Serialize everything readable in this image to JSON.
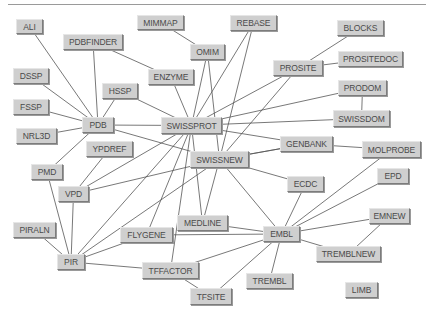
{
  "diagram": {
    "type": "database-link-graph",
    "colors": {
      "node_fill": "#cfcfcf",
      "node_text": "#4a4a4a",
      "edge": "#555555",
      "background": "#ffffff"
    },
    "nodes": [
      {
        "id": "ALI",
        "label": "ALI",
        "x": 16,
        "y": 19,
        "w": 27,
        "h": 15
      },
      {
        "id": "MIMMAP",
        "label": "MIMMAP",
        "x": 137,
        "y": 15,
        "w": 47,
        "h": 15
      },
      {
        "id": "REBASE",
        "label": "REBASE",
        "x": 230,
        "y": 15,
        "w": 47,
        "h": 16
      },
      {
        "id": "BLOCKS",
        "label": "BLOCKS",
        "x": 337,
        "y": 20,
        "w": 47,
        "h": 16
      },
      {
        "id": "PDBFINDER",
        "label": "PDBFINDER",
        "x": 63,
        "y": 34,
        "w": 60,
        "h": 16
      },
      {
        "id": "OMIM",
        "label": "OMIM",
        "x": 190,
        "y": 44,
        "w": 35,
        "h": 16
      },
      {
        "id": "PROSITEDOC",
        "label": "PROSITEDOC",
        "x": 338,
        "y": 51,
        "w": 65,
        "h": 16
      },
      {
        "id": "ENZYME",
        "label": "ENZYME",
        "x": 148,
        "y": 69,
        "w": 46,
        "h": 16
      },
      {
        "id": "PROSITE",
        "label": "PROSITE",
        "x": 273,
        "y": 60,
        "w": 50,
        "h": 16
      },
      {
        "id": "DSSP",
        "label": "DSSP",
        "x": 13,
        "y": 68,
        "w": 36,
        "h": 16
      },
      {
        "id": "PRODOM",
        "label": "PRODOM",
        "x": 338,
        "y": 80,
        "w": 49,
        "h": 16
      },
      {
        "id": "HSSP",
        "label": "HSSP",
        "x": 102,
        "y": 83,
        "w": 36,
        "h": 16
      },
      {
        "id": "FSSP",
        "label": "FSSP",
        "x": 13,
        "y": 99,
        "w": 36,
        "h": 16
      },
      {
        "id": "PDB",
        "label": "PDB",
        "x": 82,
        "y": 117,
        "w": 32,
        "h": 16
      },
      {
        "id": "SWISSPROT",
        "label": "SWISSPROT",
        "x": 161,
        "y": 117,
        "w": 61,
        "h": 17
      },
      {
        "id": "SWISSDOM",
        "label": "SWISSDOM",
        "x": 333,
        "y": 110,
        "w": 57,
        "h": 17
      },
      {
        "id": "NRL3D",
        "label": "NRL3D",
        "x": 16,
        "y": 128,
        "w": 41,
        "h": 16
      },
      {
        "id": "GENBANK",
        "label": "GENBANK",
        "x": 280,
        "y": 136,
        "w": 53,
        "h": 16
      },
      {
        "id": "YPDREF",
        "label": "YPDREF",
        "x": 86,
        "y": 141,
        "w": 47,
        "h": 16
      },
      {
        "id": "SWISSNEW",
        "label": "SWISSNEW",
        "x": 190,
        "y": 151,
        "w": 59,
        "h": 17
      },
      {
        "id": "MOLPROBE",
        "label": "MOLPROBE",
        "x": 362,
        "y": 141,
        "w": 59,
        "h": 17
      },
      {
        "id": "PMD",
        "label": "PMD",
        "x": 31,
        "y": 164,
        "w": 32,
        "h": 16
      },
      {
        "id": "ECDC",
        "label": "ECDC",
        "x": 287,
        "y": 176,
        "w": 37,
        "h": 16
      },
      {
        "id": "EPD",
        "label": "EPD",
        "x": 377,
        "y": 168,
        "w": 32,
        "h": 16
      },
      {
        "id": "VPD",
        "label": "VPD",
        "x": 58,
        "y": 186,
        "w": 31,
        "h": 16
      },
      {
        "id": "MEDLINE",
        "label": "MEDLINE",
        "x": 177,
        "y": 215,
        "w": 51,
        "h": 16
      },
      {
        "id": "EMNEW",
        "label": "EMNEW",
        "x": 369,
        "y": 208,
        "w": 41,
        "h": 16
      },
      {
        "id": "FLYGENE",
        "label": "FLYGENE",
        "x": 120,
        "y": 227,
        "w": 53,
        "h": 16
      },
      {
        "id": "EMBL",
        "label": "EMBL",
        "x": 263,
        "y": 226,
        "w": 37,
        "h": 16
      },
      {
        "id": "PIRALN",
        "label": "PIRALN",
        "x": 13,
        "y": 222,
        "w": 43,
        "h": 16
      },
      {
        "id": "TREMBLNEW",
        "label": "TREMBLNEW",
        "x": 316,
        "y": 246,
        "w": 65,
        "h": 16
      },
      {
        "id": "PIR",
        "label": "PIR",
        "x": 57,
        "y": 254,
        "w": 28,
        "h": 16
      },
      {
        "id": "TFFACTOR",
        "label": "TFFACTOR",
        "x": 142,
        "y": 262,
        "w": 57,
        "h": 17
      },
      {
        "id": "TREMBL",
        "label": "TREMBL",
        "x": 246,
        "y": 273,
        "w": 47,
        "h": 16
      },
      {
        "id": "TFSITE",
        "label": "TFSITE",
        "x": 190,
        "y": 288,
        "w": 42,
        "h": 17
      },
      {
        "id": "LIMB",
        "label": "LIMB",
        "x": 345,
        "y": 282,
        "w": 33,
        "h": 16
      }
    ],
    "edges": [
      [
        "ALI",
        "PDB"
      ],
      [
        "PDBFINDER",
        "PDB"
      ],
      [
        "DSSP",
        "PDB"
      ],
      [
        "FSSP",
        "PDB"
      ],
      [
        "NRL3D",
        "PDB"
      ],
      [
        "HSSP",
        "PDB"
      ],
      [
        "PDBFINDER",
        "ENZYME"
      ],
      [
        "MIMMAP",
        "OMIM"
      ],
      [
        "ENZYME",
        "SWISSPROT"
      ],
      [
        "HSSP",
        "SWISSPROT"
      ],
      [
        "PDB",
        "SWISSPROT"
      ],
      [
        "PDB",
        "SWISSNEW"
      ],
      [
        "OMIM",
        "SWISSPROT"
      ],
      [
        "OMIM",
        "SWISSNEW"
      ],
      [
        "REBASE",
        "SWISSPROT"
      ],
      [
        "REBASE",
        "SWISSNEW"
      ],
      [
        "PROSITE",
        "SWISSPROT"
      ],
      [
        "PROSITE",
        "SWISSNEW"
      ],
      [
        "PROSITE",
        "BLOCKS"
      ],
      [
        "PROSITE",
        "PROSITEDOC"
      ],
      [
        "PRODOM",
        "SWISSPROT"
      ],
      [
        "PRODOM",
        "SWISSDOM"
      ],
      [
        "SWISSDOM",
        "SWISSPROT"
      ],
      [
        "SWISSPROT",
        "GENBANK"
      ],
      [
        "SWISSNEW",
        "GENBANK"
      ],
      [
        "SWISSNEW",
        "ECDC"
      ],
      [
        "GENBANK",
        "MOLPROBE"
      ],
      [
        "PDB",
        "PMD"
      ],
      [
        "YPDREF",
        "VPD"
      ],
      [
        "SWISSPROT",
        "VPD"
      ],
      [
        "SWISSNEW",
        "VPD"
      ],
      [
        "PMD",
        "PIR"
      ],
      [
        "VPD",
        "PIR"
      ],
      [
        "PIRALN",
        "PIR"
      ],
      [
        "SWISSPROT",
        "PIR"
      ],
      [
        "SWISSNEW",
        "PIR"
      ],
      [
        "SWISSPROT",
        "MEDLINE"
      ],
      [
        "SWISSNEW",
        "MEDLINE"
      ],
      [
        "SWISSPROT",
        "FLYGENE"
      ],
      [
        "SWISSPROT",
        "TFFACTOR"
      ],
      [
        "PIR",
        "FLYGENE"
      ],
      [
        "PIR",
        "TFFACTOR"
      ],
      [
        "TFFACTOR",
        "TFSITE"
      ],
      [
        "SWISSNEW",
        "EMBL"
      ],
      [
        "ECDC",
        "EMBL"
      ],
      [
        "MOLPROBE",
        "EMBL"
      ],
      [
        "EPD",
        "EMBL"
      ],
      [
        "EMNEW",
        "EMBL"
      ],
      [
        "EMNEW",
        "TREMBLNEW"
      ],
      [
        "EMBL",
        "TREMBLNEW"
      ],
      [
        "EMBL",
        "TREMBL"
      ],
      [
        "EMBL",
        "MEDLINE"
      ],
      [
        "EMBL",
        "FLYGENE"
      ],
      [
        "EMBL",
        "TFFACTOR"
      ],
      [
        "EMBL",
        "TFSITE"
      ],
      [
        "GENBANK",
        "SWISSNEW"
      ]
    ]
  }
}
